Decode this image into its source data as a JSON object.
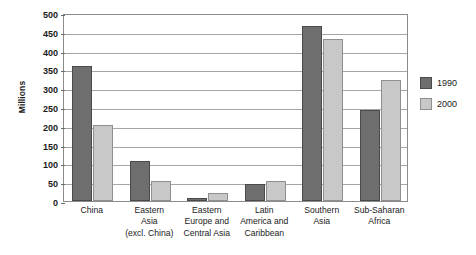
{
  "chart_data": {
    "type": "bar",
    "title": "",
    "xlabel": "",
    "ylabel": "Millions",
    "ylim": [
      0,
      500
    ],
    "ytick_step": 50,
    "yticks": [
      500,
      450,
      400,
      350,
      300,
      250,
      200,
      150,
      100,
      50,
      0
    ],
    "grid": true,
    "legend_position": "right",
    "categories": [
      "China",
      "Eastern Asia (excl. China)",
      "Eastern Europe and Central Asia",
      "Latin America and Caribbean",
      "Southern Asia",
      "Sub-Saharan Africa"
    ],
    "category_label_lines": [
      [
        "China"
      ],
      [
        "Eastern",
        "Asia",
        "(excl. China)"
      ],
      [
        "Eastern",
        "Europe and",
        "Central Asia"
      ],
      [
        "Latin",
        "America and",
        "Caribbean"
      ],
      [
        "Southern",
        "Asia"
      ],
      [
        "Sub-Saharan",
        "Africa"
      ]
    ],
    "series": [
      {
        "name": "1990",
        "color": "#6e6e6e",
        "values": [
          358,
          107,
          8,
          46,
          466,
          242
        ]
      },
      {
        "name": "2000",
        "color": "#c8c8c8",
        "values": [
          203,
          53,
          20,
          54,
          432,
          323
        ]
      }
    ]
  },
  "legend": {
    "items": [
      {
        "label": "1990",
        "color": "#6e6e6e"
      },
      {
        "label": "2000",
        "color": "#c8c8c8"
      }
    ]
  },
  "colors": {
    "series_1990": "#6e6e6e",
    "series_2000": "#c8c8c8",
    "gridline": "#a6a6a6",
    "frame": "#8c8c8c",
    "text": "#1a1a1a",
    "background": "#ffffff"
  }
}
